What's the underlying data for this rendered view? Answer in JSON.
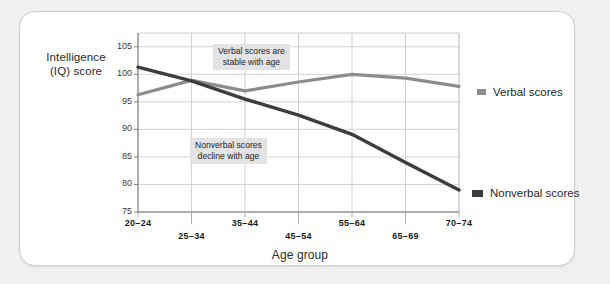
{
  "chart_data": {
    "type": "line",
    "title": "",
    "xlabel": "Age group",
    "ylabel": "Intelligence\n(IQ) score",
    "categories": [
      "20–24",
      "25–34",
      "35–44",
      "45–54",
      "55–64",
      "65–69",
      "70–74"
    ],
    "ylim": [
      75,
      107.5
    ],
    "yticks": [
      75,
      80,
      85,
      90,
      95,
      100,
      105
    ],
    "ytick_labels": [
      "75",
      "80",
      "85",
      "90",
      "95",
      "100",
      "105"
    ],
    "grid": true,
    "legend_position": "right",
    "series": [
      {
        "name": "Verbal scores",
        "color": "#8c8c8c",
        "values": [
          96.3,
          98.9,
          97.0,
          98.6,
          100.0,
          99.3,
          97.8
        ]
      },
      {
        "name": "Nonverbal scores",
        "color": "#3d3d3d",
        "values": [
          101.3,
          98.8,
          95.5,
          92.6,
          89.1,
          84.0,
          79.0
        ]
      }
    ],
    "annotations": [
      {
        "id": "verbal-note",
        "text": "Verbal scores are\nstable with age"
      },
      {
        "id": "nonverbal-note",
        "text": "Nonverbal scores\ndecline with age"
      }
    ]
  },
  "axis": {
    "y_title": "Intelligence\n(IQ) score",
    "x_title": "Age group"
  },
  "legend": {
    "items": [
      {
        "label": "Verbal scores",
        "color": "#8c8c8c"
      },
      {
        "label": "Nonverbal scores",
        "color": "#3d3d3d"
      }
    ]
  },
  "colors": {
    "page_background": "#f0f0f0",
    "card_background": "#ffffff",
    "card_border": "#cfcfcf",
    "grid": "#c8c8c8",
    "annotation_background": "#e3e3e3",
    "text": "#232323"
  }
}
